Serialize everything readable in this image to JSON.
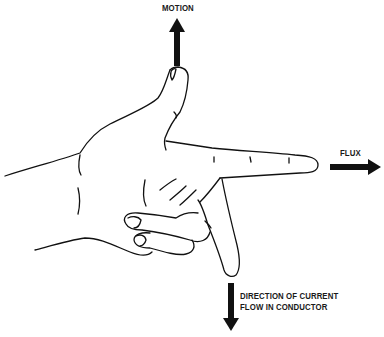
{
  "diagram": {
    "labels": {
      "motion": "MOTION",
      "flux": "FLUX",
      "current_line1": "DIRECTION OF CURRENT",
      "current_line2": "FLOW IN CONDUCTOR"
    },
    "arrows": [
      {
        "name": "motion",
        "direction": "up",
        "finger": "thumb"
      },
      {
        "name": "flux",
        "direction": "right",
        "finger": "index"
      },
      {
        "name": "current",
        "direction": "down",
        "finger": "middle"
      }
    ],
    "colors": {
      "ink": "#111111",
      "background": "#ffffff"
    }
  }
}
